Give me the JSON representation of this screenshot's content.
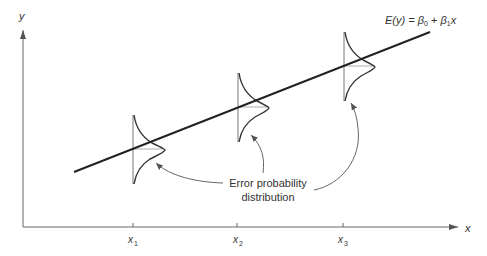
{
  "diagram": {
    "type": "regression-error-distribution",
    "axes": {
      "x_label": "x",
      "y_label": "y",
      "x_ticks": [
        {
          "base": "x",
          "sub": "1"
        },
        {
          "base": "x",
          "sub": "2"
        },
        {
          "base": "x",
          "sub": "3"
        }
      ]
    },
    "regression_line": {
      "label_lhs": "E(y) = ",
      "beta0": "β",
      "beta0_sub": "0",
      "plus": " + ",
      "beta1": "β",
      "beta1_sub": "1",
      "x_term": "x"
    },
    "annotation": {
      "line1": "Error probability",
      "line2": "distribution"
    },
    "colors": {
      "line": "#222222",
      "axis": "#666666",
      "curve": "#333333",
      "arrow": "#555555"
    }
  }
}
